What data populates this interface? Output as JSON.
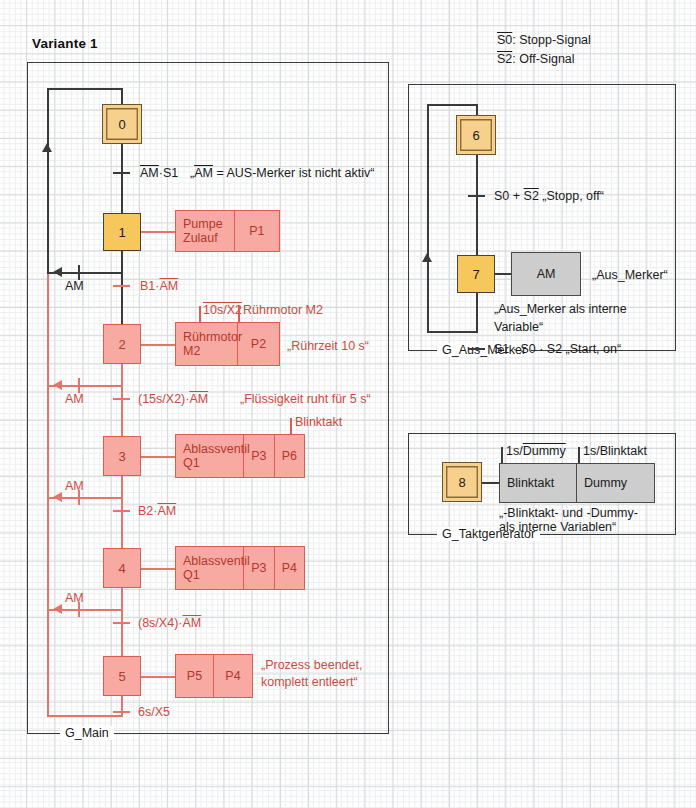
{
  "title": "Variante 1",
  "legend": [
    {
      "signal": "S0",
      "overline": true,
      "desc": ": Stopp-Signal"
    },
    {
      "signal": "S2",
      "overline": true,
      "desc": ": Off-Signal"
    }
  ],
  "frames": [
    {
      "name": "G_Main"
    },
    {
      "name": "G_Aus_Merker"
    },
    {
      "name": "G_Taktgenerator"
    }
  ],
  "main_chart": {
    "steps": [
      {
        "id": "0",
        "kind": "initial"
      },
      {
        "id": "1",
        "kind": "normal"
      },
      {
        "id": "2",
        "kind": "red"
      },
      {
        "id": "3",
        "kind": "red"
      },
      {
        "id": "4",
        "kind": "red"
      },
      {
        "id": "5",
        "kind": "red"
      }
    ],
    "actions": [
      {
        "step": "1",
        "cells": [
          "Pumpe\nZulauf",
          "P1"
        ],
        "cell1": "Pumpe",
        "cell1b": "Zulauf",
        "cell2": "P1"
      },
      {
        "step": "2",
        "cells": [
          "Rührmotor\nM2",
          "P2"
        ],
        "cell1": "Rührmotor",
        "cell1b": "M2",
        "cell2": "P2",
        "top_labels": [
          {
            "text": "10s/X2",
            "overline": true
          },
          {
            "text": "Rührmotor M2",
            "overline": false
          }
        ]
      },
      {
        "step": "3",
        "cells": [
          "Ablassventil\nQ1",
          "P3",
          "P6"
        ],
        "cell1": "Ablassventil",
        "cell1b": "Q1",
        "cell2": "P3",
        "cell3": "P6",
        "top_labels": [
          {
            "text": "Blinktakt",
            "overline": false
          }
        ]
      },
      {
        "step": "4",
        "cells": [
          "Ablassventil\nQ1",
          "P3",
          "P4"
        ],
        "cell1": "Ablassventil",
        "cell1b": "Q1",
        "cell2": "P3",
        "cell3": "P4"
      },
      {
        "step": "5",
        "cells": [
          "P5",
          "P4"
        ],
        "cell1": "P5",
        "cell2": "P4"
      }
    ],
    "transitions": [
      {
        "after": "0",
        "cond_pre": "",
        "cond_ovl": "AM",
        "cond_post": "·S1",
        "comment_pre": "„",
        "comment_ovl": "AM",
        "comment_post": " = AUS-Merker ist nicht aktiv“",
        "color": "dark"
      },
      {
        "after": "1",
        "cond_pre": "B1·",
        "cond_ovl": "AM",
        "cond_post": "",
        "comment_post": "",
        "color": "red"
      },
      {
        "after": "2",
        "cond_pre": "(15s/X2)·",
        "cond_ovl": "AM",
        "cond_post": "",
        "comment_post": "„Flüssigkeit ruht für 5 s“",
        "color": "red"
      },
      {
        "after": "3",
        "cond_pre": "B2·",
        "cond_ovl": "AM",
        "cond_post": "",
        "comment_post": "",
        "color": "red"
      },
      {
        "after": "4",
        "cond_pre": "(8s/X4)·",
        "cond_ovl": "AM",
        "cond_post": "",
        "comment_post": "",
        "color": "red"
      },
      {
        "after": "5",
        "cond_pre": "6s/X5",
        "cond_ovl": "",
        "cond_post": "",
        "comment_post": "",
        "color": "red"
      }
    ],
    "step2_side_comment": "„Rührzeit 10 s“",
    "step5_side_comment_l1": "„Prozess beendet,",
    "step5_side_comment_l2": "komplett entleert“",
    "branch_labels": [
      "AM",
      "AM",
      "AM",
      "AM"
    ]
  },
  "aus_merker_chart": {
    "steps": [
      {
        "id": "6",
        "kind": "initial"
      },
      {
        "id": "7",
        "kind": "normal"
      }
    ],
    "action": {
      "label": "AM",
      "comment": "„Aus_Merker“"
    },
    "note_l1": "„Aus_Merker als interne",
    "note_l2": "Variable“",
    "transitions": [
      {
        "after": "6",
        "pre": "S0 + ",
        "ovl": "S2",
        "post": " „Stopp, off“"
      },
      {
        "after": "7",
        "pre": "S1 · S0 · S2 „Start, on“",
        "ovl": "",
        "post": ""
      }
    ]
  },
  "taktgenerator_chart": {
    "steps": [
      {
        "id": "8",
        "kind": "initial"
      }
    ],
    "action_cells": [
      "Blinktakt",
      "Dummy"
    ],
    "top_labels": [
      {
        "pre": "1s/",
        "ovl": "Dummy"
      },
      {
        "pre": "1s/Blinktakt",
        "ovl": ""
      }
    ],
    "note_l1": "„-Blinktakt- und -Dummy-",
    "note_l2": "als interne Variablen“"
  },
  "colors": {
    "initial_step_fill": "#f7d08e",
    "step_fill": "#f6c75a",
    "red_fill": "#f7aaa2",
    "red_stroke": "#e05a4f",
    "gray_fill": "#cdcdcd",
    "line": "#3a3a3a",
    "grid": "#d6d8da"
  }
}
